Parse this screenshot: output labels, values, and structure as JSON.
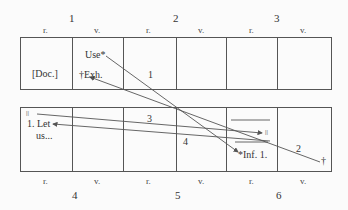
{
  "top_row": {
    "leaf_numbers": [
      "1",
      "2",
      "3"
    ],
    "sides": [
      "r.",
      "v.",
      "r.",
      "v.",
      "r.",
      "v."
    ],
    "cells": {
      "c1": "[Doc.]",
      "c2_top": "Use*",
      "c2_bottom": "†Exh.",
      "c3": "1"
    }
  },
  "bottom_row": {
    "leaf_numbers": [
      "4",
      "5",
      "6"
    ],
    "sides": [
      "r.",
      "v.",
      "r.",
      "v.",
      "r.",
      "v."
    ],
    "cells": {
      "c1_mark": "||",
      "c1_text_line1": "1. Let",
      "c1_text_line2": "us...",
      "c5_mark": "||",
      "c5_text": "*Inf. 1.",
      "c6_mark": "†"
    }
  },
  "connector_labels": {
    "line1": "1",
    "line2": "2",
    "line3": "3",
    "line4": "4"
  },
  "colors": {
    "line": "#555555",
    "border": "#555555",
    "background": "#fbfbfb"
  }
}
